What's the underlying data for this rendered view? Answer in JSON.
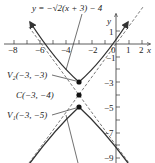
{
  "diagram": {
    "type": "hyperbola-graph",
    "equation_label": "y = −√2(x + 3) − 4",
    "axes": {
      "x_label": "x",
      "y_label": "y",
      "x_ticks": [
        "−8",
        "−6",
        "−4",
        "−2",
        "0",
        "1",
        "2"
      ],
      "y_ticks": [
        "1",
        "−1",
        "−3",
        "−5",
        "−7",
        "−9"
      ]
    },
    "points": [
      {
        "name": "V2",
        "label": "V₂(−3, −3)"
      },
      {
        "name": "C",
        "label": "C(−3, −4)"
      },
      {
        "name": "V1",
        "label": "V₁(−3, −5)"
      }
    ],
    "colors": {
      "curve": "#333333",
      "asymptote": "#555555",
      "axis": "#333333"
    }
  }
}
